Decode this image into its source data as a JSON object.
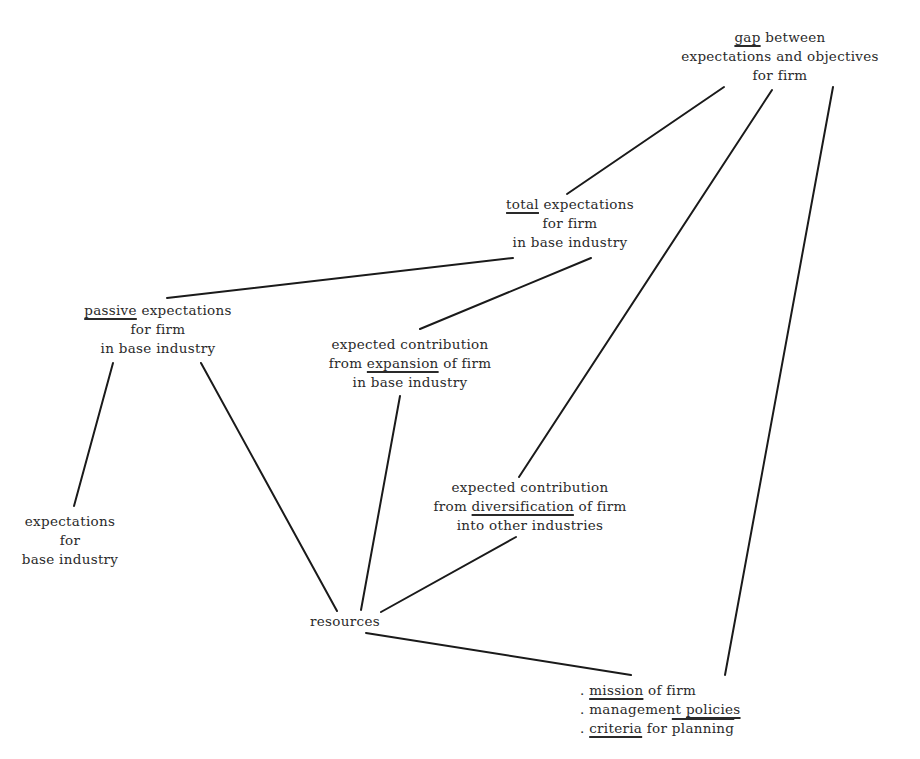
{
  "diagram": {
    "type": "concept-tree",
    "nodes": {
      "gap": {
        "keyword": "gap",
        "lines": [
          "gap between",
          "expectations and objectives",
          "for firm"
        ],
        "line1_rest": " between",
        "line2": "expectations and objectives",
        "line3": "for firm"
      },
      "total": {
        "keyword": "total",
        "line1_rest": " expectations",
        "line2": "for firm",
        "line3": "in base industry"
      },
      "passive": {
        "keyword": "passive",
        "line1_rest": " expectations",
        "line2": "for firm",
        "line3": "in base industry"
      },
      "expansion": {
        "line1": "expected contribution",
        "line2_pre": "from ",
        "keyword": "expansion",
        "line2_post": " of firm",
        "line3": "in base industry"
      },
      "diversification": {
        "line1": "expected contribution",
        "line2_pre": "from ",
        "keyword": "diversification",
        "line2_post": " of firm",
        "line3": "into other industries"
      },
      "base_industry": {
        "line1": "expectations",
        "line2": "for",
        "line3": "base industry"
      },
      "resources": {
        "label": "resources"
      },
      "mission": {
        "bullet": ". ",
        "item1_keyword": "mission",
        "item1_rest": " of firm",
        "item2_pre": "management ",
        "item2_keyword": "policies",
        "item3_keyword": "criteria",
        "item3_mid": " for ",
        "item3_rest": "planning"
      }
    },
    "edges": [
      {
        "from": "gap",
        "to": "total"
      },
      {
        "from": "gap",
        "to": "diversification"
      },
      {
        "from": "gap",
        "to": "mission"
      },
      {
        "from": "total",
        "to": "passive"
      },
      {
        "from": "total",
        "to": "expansion"
      },
      {
        "from": "passive",
        "to": "base_industry"
      },
      {
        "from": "passive",
        "to": "resources"
      },
      {
        "from": "expansion",
        "to": "resources"
      },
      {
        "from": "diversification",
        "to": "resources"
      },
      {
        "from": "resources",
        "to": "mission"
      }
    ]
  }
}
